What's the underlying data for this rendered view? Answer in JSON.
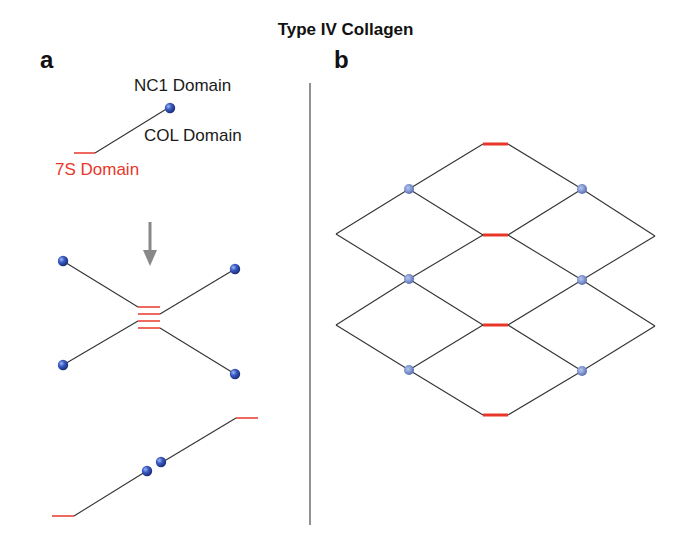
{
  "title": "Type IV Collagen",
  "panels": {
    "a": {
      "label": "a",
      "labels": {
        "nc1": "NC1 Domain",
        "col": "COL Domain",
        "s7": "7S Domain"
      }
    },
    "b": {
      "label": "b"
    }
  },
  "colors": {
    "line": "#333333",
    "domain_7s": "#e8372a",
    "nc1_node": "#3355bb",
    "nc1_node_lattice": "#7f95d0",
    "arrow": "#888888",
    "divider": "#555555"
  }
}
